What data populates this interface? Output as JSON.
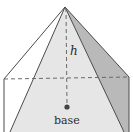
{
  "diagram": {
    "type": "pyramid",
    "labels": {
      "height": "h",
      "base": "base"
    },
    "colors": {
      "front_face": "#e6e6e6",
      "right_face": "#b9b9b9",
      "left_face": "#ffffff",
      "edge": "#4a4a4a",
      "dashed": "#6a6a6a",
      "base_point": "#444444"
    }
  }
}
